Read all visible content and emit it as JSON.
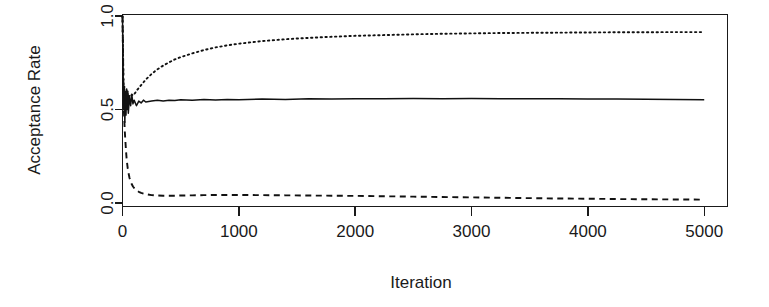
{
  "chart_data": {
    "type": "line",
    "title": "",
    "subtitle": "",
    "xlabel": "Iteration",
    "ylabel": "Acceptance Rate",
    "xlim": [
      0,
      5200
    ],
    "ylim": [
      0.0,
      1.02
    ],
    "xticks": [
      0,
      1000,
      2000,
      3000,
      4000,
      5000
    ],
    "xticklabels": [
      "0",
      "1000",
      "2000",
      "3000",
      "4000",
      "5000"
    ],
    "yticks": [
      0.0,
      0.5,
      1.0
    ],
    "yticklabels": [
      "0.0",
      "0.5",
      "1.0"
    ],
    "grid": false,
    "legend": false,
    "legend_position": "none",
    "box": true,
    "x": [
      0,
      5,
      10,
      15,
      20,
      25,
      30,
      35,
      40,
      45,
      50,
      60,
      70,
      80,
      90,
      100,
      120,
      140,
      160,
      180,
      200,
      250,
      300,
      350,
      400,
      450,
      500,
      600,
      700,
      800,
      900,
      1000,
      1200,
      1400,
      1600,
      1800,
      2000,
      2250,
      2500,
      2750,
      3000,
      3250,
      3500,
      3750,
      4000,
      4250,
      4500,
      4750,
      5000
    ],
    "series": [
      {
        "name": "solid",
        "linestyle": "solid",
        "color": "#111111",
        "values": [
          1.0,
          0.72,
          0.5,
          0.62,
          0.43,
          0.58,
          0.47,
          0.6,
          0.5,
          0.56,
          0.48,
          0.57,
          0.52,
          0.58,
          0.53,
          0.55,
          0.52,
          0.545,
          0.535,
          0.55,
          0.54,
          0.545,
          0.55,
          0.545,
          0.55,
          0.548,
          0.552,
          0.55,
          0.553,
          0.551,
          0.554,
          0.552,
          0.556,
          0.554,
          0.557,
          0.556,
          0.558,
          0.557,
          0.559,
          0.558,
          0.559,
          0.558,
          0.557,
          0.557,
          0.556,
          0.556,
          0.555,
          0.554,
          0.552
        ]
      },
      {
        "name": "dotted",
        "linestyle": "dotted",
        "color": "#111111",
        "values": [
          1.0,
          0.78,
          0.6,
          0.63,
          0.5,
          0.6,
          0.52,
          0.61,
          0.54,
          0.6,
          0.55,
          0.575,
          0.57,
          0.58,
          0.575,
          0.58,
          0.6,
          0.615,
          0.63,
          0.645,
          0.66,
          0.69,
          0.715,
          0.735,
          0.752,
          0.768,
          0.78,
          0.8,
          0.818,
          0.832,
          0.843,
          0.852,
          0.866,
          0.876,
          0.883,
          0.889,
          0.894,
          0.898,
          0.902,
          0.905,
          0.907,
          0.909,
          0.91,
          0.911,
          0.912,
          0.913,
          0.913,
          0.914,
          0.914
        ]
      },
      {
        "name": "dashed",
        "linestyle": "dashed",
        "color": "#111111",
        "values": [
          1.0,
          0.78,
          0.52,
          0.45,
          0.38,
          0.33,
          0.28,
          0.24,
          0.21,
          0.185,
          0.165,
          0.135,
          0.115,
          0.1,
          0.088,
          0.08,
          0.068,
          0.06,
          0.054,
          0.05,
          0.047,
          0.042,
          0.04,
          0.039,
          0.039,
          0.039,
          0.04,
          0.041,
          0.042,
          0.043,
          0.043,
          0.043,
          0.042,
          0.041,
          0.04,
          0.039,
          0.038,
          0.036,
          0.034,
          0.032,
          0.03,
          0.028,
          0.026,
          0.024,
          0.023,
          0.021,
          0.02,
          0.019,
          0.018
        ]
      }
    ]
  },
  "axes": {
    "ylabel": "Acceptance Rate",
    "xlabel": "Iteration",
    "xtick_0": "0",
    "xtick_1": "1000",
    "xtick_2": "2000",
    "xtick_3": "3000",
    "xtick_4": "4000",
    "xtick_5": "5000",
    "ytick_0": "0.0",
    "ytick_1": "0.5",
    "ytick_2": "1.0"
  },
  "colors": {
    "ink": "#111111",
    "background": "#ffffff"
  }
}
